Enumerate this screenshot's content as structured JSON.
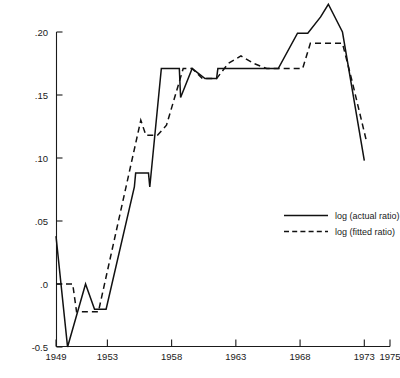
{
  "chart_data": {
    "type": "line",
    "title": "",
    "subtitle": "",
    "xlabel": "",
    "ylabel": "",
    "xlim": [
      1949,
      1975
    ],
    "ylim": [
      -0.05,
      0.2
    ],
    "grid": false,
    "legend_position": "center-right",
    "x_tick_labels": [
      "1949",
      "1953",
      "1958",
      "1963",
      "1968",
      "1973",
      "1975"
    ],
    "x_tick_values": [
      1949,
      1953,
      1958,
      1963,
      1968,
      1973,
      1975
    ],
    "x_minor_tick_values": [
      1950,
      1951,
      1952,
      1954,
      1955,
      1956,
      1957,
      1959,
      1960,
      1961,
      1962,
      1964,
      1965,
      1966,
      1967,
      1969,
      1970,
      1971,
      1972,
      1974
    ],
    "y_tick_labels": [
      ".20",
      ".15",
      ".10",
      ".05",
      ".0",
      "-0.5"
    ],
    "y_tick_values": [
      0.2,
      0.15,
      0.1,
      0.05,
      0.0,
      -0.05
    ],
    "series": [
      {
        "name": "log (actual ratio)",
        "style": "solid",
        "color": "#111111",
        "x": [
          1949.0,
          1949.9,
          1951.3,
          1952.0,
          1952.9,
          1955.1,
          1955.2,
          1956.2,
          1956.3,
          1957.2,
          1957.3,
          1958.6,
          1958.7,
          1959.6,
          1960.6,
          1961.5,
          1961.6,
          1963.1,
          1964.0,
          1966.2,
          1966.3,
          1967.8,
          1968.6,
          1969.6,
          1970.2,
          1971.3,
          1973.0
        ],
        "y": [
          0.038,
          -0.05,
          0.0,
          -0.02,
          -0.02,
          0.077,
          0.088,
          0.088,
          0.077,
          0.171,
          0.171,
          0.171,
          0.148,
          0.171,
          0.163,
          0.163,
          0.171,
          0.171,
          0.171,
          0.171,
          0.171,
          0.199,
          0.199,
          0.212,
          0.222,
          0.2,
          0.098
        ]
      },
      {
        "name": "log (fitted ratio)",
        "style": "dashed",
        "color": "#111111",
        "x": [
          1949.0,
          1950.3,
          1950.6,
          1952.2,
          1952.3,
          1955.6,
          1956.0,
          1956.9,
          1957.6,
          1958.9,
          1959.6,
          1960.4,
          1961.5,
          1962.4,
          1963.4,
          1964.4,
          1965.4,
          1966.2,
          1967.0,
          1968.2,
          1968.8,
          1971.3,
          1972.0,
          1973.2
        ],
        "y": [
          0.0,
          0.0,
          -0.022,
          -0.022,
          -0.022,
          0.13,
          0.118,
          0.118,
          0.126,
          0.171,
          0.171,
          0.163,
          0.163,
          0.175,
          0.181,
          0.175,
          0.171,
          0.171,
          0.171,
          0.171,
          0.191,
          0.191,
          0.163,
          0.112
        ]
      }
    ]
  },
  "legend": {
    "items": [
      {
        "label": "log (actual ratio)",
        "style": "solid"
      },
      {
        "label": "log (fitted ratio)",
        "style": "dashed"
      }
    ]
  }
}
